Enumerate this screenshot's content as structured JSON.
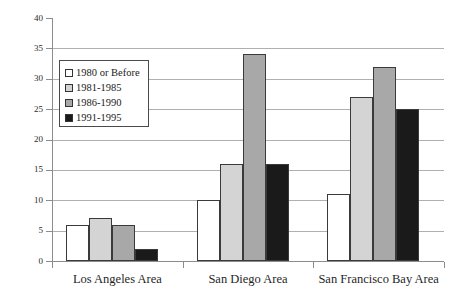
{
  "chart_data": {
    "type": "bar",
    "title": "",
    "subtitle": "",
    "xlabel": "",
    "ylabel": "",
    "categories": [
      "Los Angeles Area",
      "San Diego Area",
      "San Francisco Bay Area"
    ],
    "series": [
      {
        "name": "1980 or Before",
        "values": [
          6,
          10,
          11
        ],
        "color": "#ffffff"
      },
      {
        "name": "1981-1985",
        "values": [
          7,
          16,
          27
        ],
        "color": "#d4d4d4"
      },
      {
        "name": "1986-1990",
        "values": [
          6,
          34,
          32
        ],
        "color": "#a8a8a8"
      },
      {
        "name": "1991-1995",
        "values": [
          2,
          16,
          25
        ],
        "color": "#1a1a1a"
      }
    ],
    "ylim": [
      0,
      40
    ],
    "ytick_step": 5,
    "yticks": [
      0,
      5,
      10,
      15,
      20,
      25,
      30,
      35,
      40
    ],
    "ytick_labels": [
      "0",
      "5",
      "10",
      "15",
      "20",
      "25",
      "30",
      "35",
      "40"
    ],
    "gridlines_at": [
      5,
      10,
      15,
      20,
      25,
      30,
      35
    ],
    "grid": true,
    "legend_position": "upper-left-inside",
    "bar_outline_color": "#3a3a3a",
    "grid_color": "#b0b0b0",
    "axis_color": "#8c8c8c",
    "annotations": []
  },
  "legend": {
    "entries": [
      {
        "label": "1980 or Before",
        "color": "#ffffff"
      },
      {
        "label": "1981-1985",
        "color": "#d4d4d4"
      },
      {
        "label": "1986-1990",
        "color": "#a8a8a8"
      },
      {
        "label": "1991-1995",
        "color": "#1a1a1a"
      }
    ]
  }
}
